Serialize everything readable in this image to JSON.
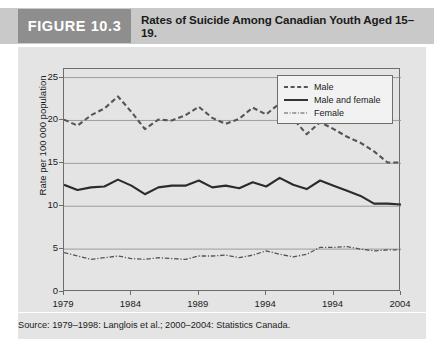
{
  "header": {
    "figure_number": "FIGURE 10.3",
    "title": "Rates of Suicide Among Canadian Youth Aged 15–19.",
    "figure_number_bg": "#8e8e8e",
    "header_bg": "#c9c9c9"
  },
  "source": {
    "text": "Source: 1979–1998: Langlois et al.; 2000–2004: Statistics Canada."
  },
  "legend": {
    "position": "top-right",
    "entries": [
      {
        "label": "Male",
        "style": "dashed"
      },
      {
        "label": "Male and female",
        "style": "solid"
      },
      {
        "label": "Female",
        "style": "dash-dot"
      }
    ]
  },
  "chart_data": {
    "type": "line",
    "title": "Rates of Suicide Among Canadian Youth Aged 15–19.",
    "xlabel": "",
    "ylabel": "Rate per 100 000 population",
    "xlim": [
      1979,
      2004
    ],
    "ylim": [
      0,
      26
    ],
    "grid": true,
    "y_ticks": [
      0,
      5,
      10,
      15,
      20,
      25
    ],
    "y_tick_labels": [
      "0",
      "5",
      "10",
      "15",
      "20",
      "25"
    ],
    "x_ticks": [
      1979,
      1984,
      1989,
      1994,
      1999,
      2004
    ],
    "x_tick_labels": [
      "1979",
      "1984",
      "1989",
      "1994",
      "1994",
      "2004"
    ],
    "x": [
      1979,
      1980,
      1981,
      1982,
      1983,
      1984,
      1985,
      1986,
      1987,
      1988,
      1989,
      1990,
      1991,
      1992,
      1993,
      1994,
      1995,
      1996,
      1997,
      1998,
      1999,
      2000,
      2001,
      2002,
      2003,
      2004
    ],
    "series": [
      {
        "name": "Male",
        "style": "dashed",
        "color": "#555555",
        "values": [
          20.1,
          19.4,
          20.6,
          21.4,
          22.8,
          21.0,
          19.0,
          20.1,
          20.0,
          20.6,
          21.6,
          20.3,
          19.6,
          20.2,
          21.5,
          20.7,
          22.0,
          20.2,
          18.4,
          19.8,
          19.0,
          18.1,
          17.4,
          16.4,
          15.1,
          15.1
        ]
      },
      {
        "name": "Male and female",
        "style": "solid",
        "color": "#2b2b2b",
        "values": [
          12.5,
          11.9,
          12.2,
          12.3,
          13.1,
          12.4,
          11.4,
          12.2,
          12.4,
          12.4,
          13.0,
          12.2,
          12.4,
          12.1,
          12.8,
          12.3,
          13.3,
          12.5,
          12.0,
          13.0,
          12.4,
          11.8,
          11.2,
          10.3,
          10.3,
          10.2
        ]
      },
      {
        "name": "Female",
        "style": "dash-dot",
        "color": "#555555",
        "values": [
          4.6,
          4.2,
          3.8,
          4.0,
          4.2,
          3.9,
          3.8,
          4.0,
          3.9,
          3.8,
          4.2,
          4.2,
          4.3,
          4.0,
          4.3,
          4.8,
          4.4,
          4.1,
          4.4,
          5.2,
          5.2,
          5.3,
          5.0,
          4.8,
          4.9,
          4.9
        ]
      }
    ]
  }
}
